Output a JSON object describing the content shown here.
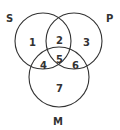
{
  "diagram": {
    "type": "venn-3",
    "sets": [
      {
        "id": "S",
        "label": "S"
      },
      {
        "id": "P",
        "label": "P"
      },
      {
        "id": "M",
        "label": "M"
      }
    ],
    "regions": [
      {
        "label": "1",
        "in": [
          "S"
        ]
      },
      {
        "label": "2",
        "in": [
          "S",
          "P"
        ]
      },
      {
        "label": "3",
        "in": [
          "P"
        ]
      },
      {
        "label": "4",
        "in": [
          "S",
          "M"
        ]
      },
      {
        "label": "5",
        "in": [
          "S",
          "P",
          "M"
        ]
      },
      {
        "label": "6",
        "in": [
          "P",
          "M"
        ]
      },
      {
        "label": "7",
        "in": [
          "M"
        ]
      }
    ],
    "colors": {
      "stroke": "#333333",
      "text": "#333333",
      "background": "#ffffff"
    }
  }
}
